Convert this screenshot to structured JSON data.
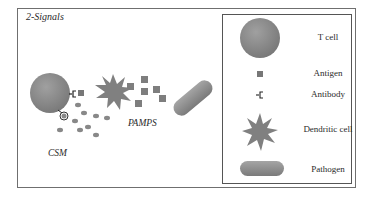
{
  "diagram": {
    "title": "2-Signals",
    "labels": {
      "csm": "CSM",
      "pamps": "PAMPS"
    },
    "legend": {
      "items": [
        {
          "icon": "t-cell-icon",
          "label": "T cell"
        },
        {
          "icon": "antigen-icon",
          "label": "Antigen"
        },
        {
          "icon": "antibody-icon",
          "label": "Antibody"
        },
        {
          "icon": "dendritic-cell-icon",
          "label": "Dendritic cell"
        },
        {
          "icon": "pathogen-icon",
          "label": "Pathogen"
        }
      ]
    },
    "colors": {
      "shape_fill": "#8a8a8a",
      "border": "#6f6f6f",
      "text": "#2a2a2a"
    }
  }
}
